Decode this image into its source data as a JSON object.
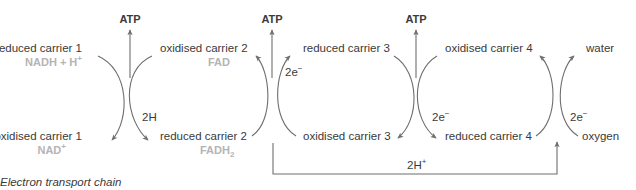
{
  "caption": "Electron transport chain",
  "atp": {
    "label": "ATP"
  },
  "carriers": {
    "c1_reduced": {
      "label": "reduced carrier 1",
      "chem": "NADH + H",
      "chem_sup": "+"
    },
    "c1_oxidised": {
      "label": "oxidised carrier 1",
      "chem": "NAD",
      "chem_sup": "+"
    },
    "c2_oxidised": {
      "label": "oxidised carrier 2",
      "chem": "FAD"
    },
    "c2_reduced": {
      "label": "reduced carrier 2",
      "chem": "FADH",
      "chem_sub": "2"
    },
    "c3_reduced": {
      "label": "reduced carrier 3"
    },
    "c3_oxidised": {
      "label": "oxidised carrier 3"
    },
    "c4_oxidised": {
      "label": "oxidised carrier 4"
    },
    "c4_reduced": {
      "label": "reduced carrier 4"
    },
    "water": {
      "label": "water"
    },
    "oxygen": {
      "label": "oxygen"
    }
  },
  "transfers": {
    "t1": {
      "label": "2H"
    },
    "t2": {
      "label": "2e",
      "sup": "−"
    },
    "t3": {
      "label": "2e",
      "sup": "−"
    },
    "t4": {
      "label": "2e",
      "sup": "−"
    },
    "proton": {
      "label": "2H",
      "sup": "+"
    }
  },
  "colors": {
    "text": "#3a3a3a",
    "chem": "#b4b4b4",
    "arrow": "#6e6e6e"
  }
}
